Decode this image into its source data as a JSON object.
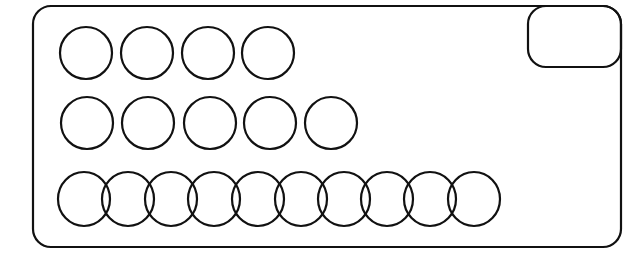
{
  "diagram": {
    "stroke_color": "#111111",
    "background": "#ffffff",
    "outer_box": {
      "x": 33,
      "y": 6,
      "w": 588,
      "h": 241,
      "r": 18
    },
    "corner_box": {
      "x": 528,
      "y": 6,
      "w": 93,
      "h": 61,
      "r": 18
    },
    "rows": [
      {
        "count": 4,
        "cy": 53,
        "rx": 26,
        "ry": 26,
        "cx": [
          86,
          147,
          208,
          268
        ]
      },
      {
        "count": 5,
        "cy": 123,
        "rx": 26,
        "ry": 26,
        "cx": [
          87,
          148,
          210,
          270,
          331
        ]
      },
      {
        "count": 10,
        "cy": 199,
        "rx": 26,
        "ry": 27,
        "cx": [
          84,
          128,
          171,
          214,
          258,
          301,
          344,
          387,
          430,
          474
        ]
      }
    ]
  }
}
